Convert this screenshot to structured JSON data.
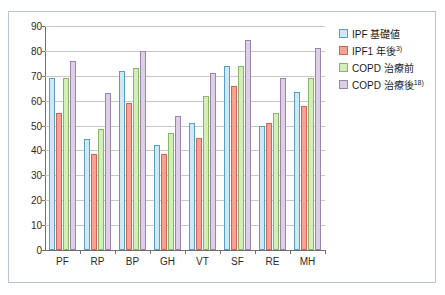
{
  "top_fragment": {
    "f1": "",
    "f2": "",
    "f3": ""
  },
  "chart_data": {
    "type": "bar",
    "title": "",
    "xlabel": "",
    "ylabel": "",
    "ylim": [
      0,
      90
    ],
    "y_ticks": [
      0,
      10,
      20,
      30,
      40,
      50,
      60,
      70,
      80,
      90
    ],
    "grid": true,
    "legend_position": "right",
    "categories": [
      "PF",
      "RP",
      "BP",
      "GH",
      "VT",
      "SF",
      "RE",
      "MH"
    ],
    "series": [
      {
        "name": "IPF 基礎値",
        "name_base": "IPF 基礎値",
        "name_sup": "",
        "color": "#cfe8f7",
        "border": "#5a9ec4",
        "values": [
          69,
          44.5,
          72,
          42,
          51,
          74,
          50,
          63.5
        ]
      },
      {
        "name": "IPF1 年後3)",
        "name_base": "IPF1 年後",
        "name_sup": "3)",
        "color": "#f9a294",
        "border": "#d4645a",
        "values": [
          55,
          38.5,
          59,
          38.5,
          45,
          66,
          51,
          58
        ]
      },
      {
        "name": "COPD 治療前",
        "name_base": "COPD 治療前",
        "name_sup": "",
        "color": "#d3eeb6",
        "border": "#85b765",
        "values": [
          69,
          48.5,
          73,
          47,
          62,
          74,
          55,
          69
        ]
      },
      {
        "name": "COPD 治療後18)",
        "name_base": "COPD 治療後",
        "name_sup": "18)",
        "color": "#ddcfe6",
        "border": "#9d84ae",
        "values": [
          76,
          63,
          80,
          54,
          71,
          84.5,
          69,
          81
        ]
      }
    ]
  }
}
